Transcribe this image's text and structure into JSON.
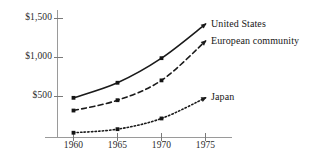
{
  "chart_data": {
    "type": "line",
    "title": "",
    "subtitle": "",
    "xlabel": "",
    "ylabel": "",
    "x": [
      1960,
      1965,
      1970,
      1975
    ],
    "categories": [
      "1960",
      "1965",
      "1970",
      "1975"
    ],
    "xlim": [
      1958.3,
      1977.5
    ],
    "ylim": [
      0,
      1700
    ],
    "grid": false,
    "legend_position": "inline-right-of-line-ends",
    "y_ticks": [
      500,
      1000,
      1500
    ],
    "y_tick_labels": [
      "$500",
      "$1,000",
      "$1,500"
    ],
    "x_ticks": [
      1960,
      1965,
      1970,
      1975
    ],
    "x_tick_labels": [
      "1960",
      "1965",
      "1970",
      "1975"
    ],
    "series": [
      {
        "name": "United States",
        "label": "United States",
        "line_style": "solid",
        "marker": "square",
        "color": "#1a1a1a",
        "values": [
          500,
          690,
          1000,
          1430
        ]
      },
      {
        "name": "European community",
        "label": "European community",
        "line_style": "dashed",
        "marker": "square",
        "color": "#1a1a1a",
        "values": [
          340,
          470,
          720,
          1215
        ]
      },
      {
        "name": "Japan",
        "label": "Japan",
        "line_style": "dotted",
        "marker": "square",
        "color": "#1a1a1a",
        "values": [
          60,
          105,
          240,
          500
        ]
      }
    ]
  },
  "axes": {
    "y_labels": [
      {
        "text": "$1,500",
        "top": 12,
        "right": 52
      },
      {
        "text": "$1,000",
        "top": 51,
        "right": 52
      },
      {
        "text": "$500",
        "top": 90,
        "right": 52
      }
    ],
    "x_labels": [
      {
        "text": "1960",
        "left": 73,
        "top": 139
      },
      {
        "text": "1965",
        "left": 117,
        "top": 139
      },
      {
        "text": "1970",
        "left": 161,
        "top": 139
      },
      {
        "text": "1975",
        "left": 205,
        "top": 139
      }
    ]
  },
  "series_labels": [
    {
      "text": "United States",
      "left": 211,
      "top": 19
    },
    {
      "text": "European community",
      "left": 211,
      "top": 35
    },
    {
      "text": "Japan",
      "left": 211,
      "top": 91
    }
  ],
  "colors": {
    "background": "#ffffff",
    "ink": "#1a1a1a",
    "axis": "#8c8c8c"
  }
}
